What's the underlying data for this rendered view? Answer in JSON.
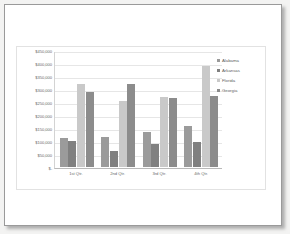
{
  "chart_data": {
    "type": "bar",
    "title": "",
    "xlabel": "",
    "ylabel": "",
    "categories": [
      "1st Qtr.",
      "2nd Qtr.",
      "3rd Qtr.",
      "4th Qtr."
    ],
    "series": [
      {
        "name": "Alabama",
        "color": "#9b9b9b",
        "values": [
          110000,
          117000,
          133000,
          157000
        ]
      },
      {
        "name": "Arkansas",
        "color": "#808080",
        "values": [
          100000,
          63000,
          88000,
          97000
        ]
      },
      {
        "name": "Florida",
        "color": "#c9c9c9",
        "values": [
          320000,
          252000,
          270000,
          388000
        ]
      },
      {
        "name": "Georgia",
        "color": "#8c8c8c",
        "values": [
          290000,
          320000,
          267000,
          272000
        ]
      }
    ],
    "ylim": [
      0,
      450000
    ],
    "ytick_values": [
      450000,
      400000,
      350000,
      300000,
      250000,
      200000,
      150000,
      100000,
      50000,
      0
    ],
    "ytick_labels": [
      "$450,000",
      "$400,000",
      "$350,000",
      "$300,000",
      "$250,000",
      "$200,000",
      "$150,000",
      "$100,000",
      "$50,000",
      "$-"
    ],
    "grid": true,
    "legend_position": "right"
  },
  "legend": {
    "items": [
      {
        "label": "Alabama"
      },
      {
        "label": "Arkansas"
      },
      {
        "label": "Florida"
      },
      {
        "label": "Georgia"
      }
    ]
  },
  "colors": {
    "page_background": "#ffffff",
    "canvas_background": "#f3f3f2",
    "gridline": "#e6e6e6",
    "axis_text": "#6a6a6a",
    "chart_border": "#e2e2e2",
    "page_border": "#9a9a9a"
  }
}
